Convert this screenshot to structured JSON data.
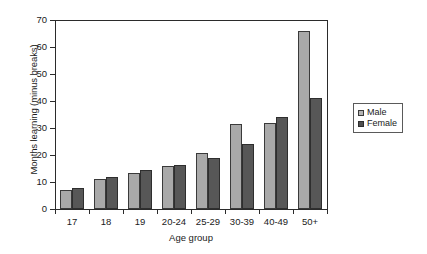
{
  "chart_data": {
    "type": "bar",
    "title": "",
    "subtitle": "",
    "xlabel": "Age group",
    "ylabel": "Months learning (minus breaks)",
    "categories": [
      "17",
      "18",
      "19",
      "20-24",
      "25-29",
      "30-39",
      "40-49",
      "50+"
    ],
    "series": [
      {
        "name": "Male",
        "color": "#a9a9a9",
        "values": [
          7.0,
          11.3,
          13.5,
          15.9,
          20.8,
          31.5,
          32.0,
          65.8
        ]
      },
      {
        "name": "Female",
        "color": "#575757",
        "values": [
          7.6,
          12.0,
          14.3,
          16.4,
          19.0,
          24.2,
          34.0,
          41.0
        ]
      }
    ],
    "ylim": [
      0,
      70
    ],
    "ytick_values": [
      0,
      10,
      20,
      30,
      40,
      50,
      60,
      70
    ],
    "ytick_labels": [
      "0",
      "10",
      "20",
      "30",
      "40",
      "50",
      "60",
      "70"
    ],
    "grid": false,
    "legend_position": "right",
    "legend_entries": [
      "Male",
      "Female"
    ]
  },
  "axes": {
    "y_title": "Months learning (minus breaks)",
    "x_title": "Age group"
  },
  "legend": {
    "items": [
      {
        "label": "Male",
        "swatch": "legend-swatch-male"
      },
      {
        "label": "Female",
        "swatch": "legend-swatch-female"
      }
    ]
  }
}
